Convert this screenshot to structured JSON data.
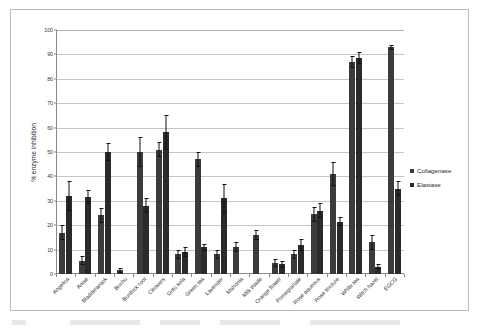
{
  "chart_data": {
    "type": "bar",
    "title": "",
    "xlabel": "",
    "ylabel": "% enzyme inhibition",
    "ylim": [
      0,
      100
    ],
    "ytick_step": 10,
    "yticks": [
      0,
      10,
      20,
      30,
      40,
      50,
      60,
      70,
      80,
      90,
      100
    ],
    "grid": true,
    "legend_position": "right",
    "categories": [
      "Angelica",
      "Anise",
      "Bladderwrack",
      "Buchu",
      "Burdock root",
      "Cleavers",
      "Gotu kola",
      "Green tea",
      "Lavender",
      "Mahonia",
      "Milk thistle",
      "Orange flower",
      "Pomegranate",
      "Rose aqueous",
      "Rose tincture",
      "White tea",
      "Witch hazel",
      "EGCG"
    ],
    "series": [
      {
        "name": "Collagenase",
        "color": "#3b3b3b",
        "values": [
          17,
          5.5,
          24,
          1.5,
          50,
          51,
          8,
          47,
          8,
          11,
          16,
          4.5,
          8,
          24.5,
          41,
          87,
          13,
          93
        ],
        "errors": [
          3,
          2,
          3,
          1,
          6,
          3,
          2,
          3,
          2,
          2,
          2,
          1.5,
          2,
          3,
          5,
          2.5,
          3,
          1
        ]
      },
      {
        "name": "Elastase",
        "color": "#2a2a2a",
        "values": [
          32,
          31.5,
          50,
          0,
          28,
          58,
          9,
          11,
          31,
          0,
          0,
          4,
          12,
          26,
          21.5,
          88.5,
          3,
          35
        ],
        "errors": [
          6,
          3,
          3.5,
          0,
          3,
          7,
          2,
          1.5,
          6,
          0,
          0,
          1.5,
          2.5,
          3,
          2,
          2.5,
          1,
          3
        ]
      }
    ]
  },
  "legend": {
    "entries": [
      {
        "label": "Collagenase",
        "color": "#3b3b3b"
      },
      {
        "label": "Elastase",
        "color": "#2a2a2a"
      }
    ]
  },
  "axes": {
    "y_title": "% enzyme inhibition"
  }
}
